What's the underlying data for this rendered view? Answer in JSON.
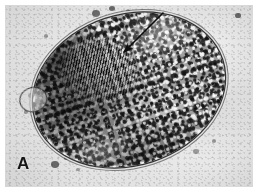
{
  "figure": {
    "domain": "light-micrograph",
    "panel_label": "A",
    "caption_visible": false,
    "colors": {
      "page_background": "#ffffff",
      "plate_background": "#d6d6d6",
      "specimen_mid": "#9a9a9a",
      "specimen_dark": "#1a1a1a",
      "specimen_light": "#f2f2f2",
      "annotation": "#0d0d0d",
      "label_text": "#151515"
    }
  },
  "plate": {
    "name": "micrograph-plate",
    "x": 5,
    "y": 5,
    "width": 248,
    "height": 182
  },
  "specimen": {
    "name": "protozoan-cyst",
    "shape": "ovoid",
    "rotation_deg": -18,
    "features": [
      {
        "name": "cyst-wall",
        "label": "double-layered cyst wall"
      },
      {
        "name": "cytoplasm-granules",
        "label": "granular cytoplasm"
      },
      {
        "name": "striated-region",
        "label": "striated region"
      },
      {
        "name": "polar-cap",
        "label": "dark polar thickening"
      },
      {
        "name": "lateral-bleb",
        "label": "lateral bleb"
      }
    ]
  },
  "annotation": {
    "name": "pointer-arrow",
    "kind": "arrow",
    "points_to": "striated-region",
    "tail": {
      "x": 163,
      "y": 13
    },
    "tip": {
      "x": 124,
      "y": 52
    },
    "color": "#0d0d0d",
    "stroke_width": 1.6
  },
  "debris": [
    {
      "x": 96,
      "y": 14,
      "r": 4.0,
      "big": true
    },
    {
      "x": 112,
      "y": 9,
      "r": 3.0,
      "big": true
    },
    {
      "x": 128,
      "y": 11,
      "r": 2.2,
      "big": false
    },
    {
      "x": 141,
      "y": 16,
      "r": 3.6,
      "big": true
    },
    {
      "x": 152,
      "y": 21,
      "r": 2.6,
      "big": true
    },
    {
      "x": 176,
      "y": 19,
      "r": 3.2,
      "big": true
    },
    {
      "x": 189,
      "y": 24,
      "r": 2.4,
      "big": false
    },
    {
      "x": 238,
      "y": 16,
      "r": 2.8,
      "big": true
    },
    {
      "x": 31,
      "y": 96,
      "r": 3.4,
      "big": true
    },
    {
      "x": 26,
      "y": 112,
      "r": 2.2,
      "big": false
    },
    {
      "x": 55,
      "y": 165,
      "r": 4.4,
      "big": true
    },
    {
      "x": 66,
      "y": 158,
      "r": 2.4,
      "big": true
    },
    {
      "x": 78,
      "y": 170,
      "r": 2.0,
      "big": false
    },
    {
      "x": 196,
      "y": 152,
      "r": 2.6,
      "big": false
    },
    {
      "x": 214,
      "y": 141,
      "r": 2.2,
      "big": false
    },
    {
      "x": 46,
      "y": 36,
      "r": 2.4,
      "big": false
    }
  ]
}
